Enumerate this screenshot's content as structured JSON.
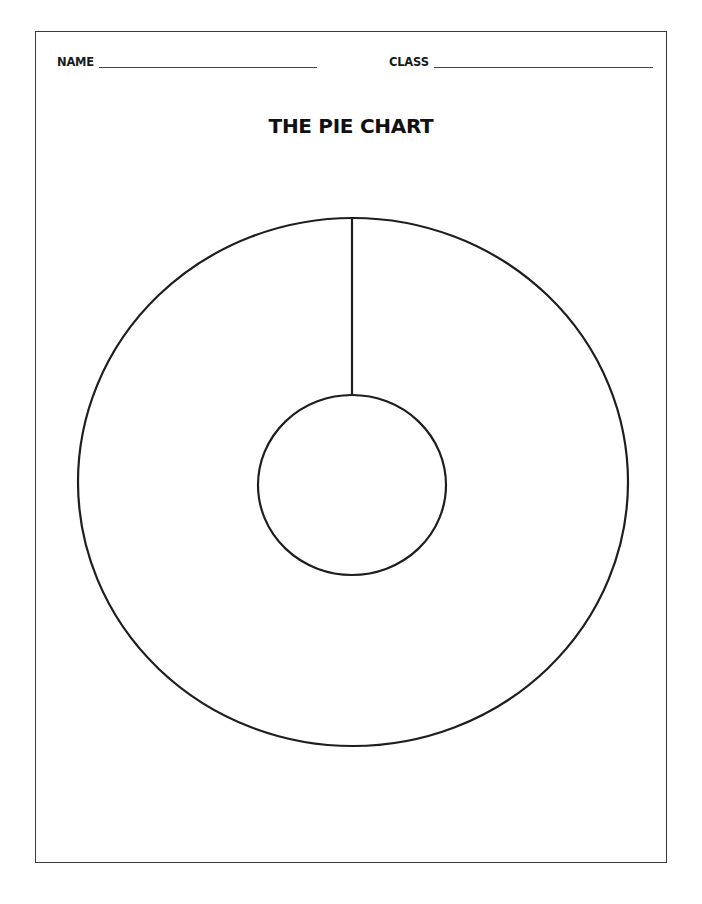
{
  "worksheet": {
    "name_label": "NAME",
    "name_value": "",
    "class_label": "CLASS",
    "class_value": "",
    "title": "THE PIE CHART"
  },
  "diagram": {
    "type": "blank-pie-chart-template",
    "outer_circle": {
      "cx": 353,
      "cy": 482,
      "rx": 275,
      "ry": 264
    },
    "inner_circle": {
      "cx": 352,
      "cy": 485,
      "rx": 94,
      "ry": 90
    },
    "divider_line": {
      "x": 352,
      "y1": 218,
      "y2": 395
    },
    "stroke_color": "#1e1e1e"
  }
}
